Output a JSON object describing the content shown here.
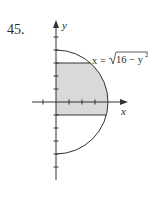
{
  "problem": {
    "number": "45."
  },
  "diagram": {
    "axes": {
      "x_label": "x",
      "y_label": "y",
      "unit_px": 13,
      "x_ticks": [
        -1,
        1,
        2,
        3
      ],
      "y_ticks": [
        -4,
        -3,
        -2,
        -1,
        1,
        2,
        3,
        4,
        5
      ]
    },
    "curve": {
      "equation_lhs": "x =",
      "equation_rhs": "16 − y",
      "exponent": "2",
      "description": "right half of circle of radius 4",
      "radius": 4
    },
    "shaded_region": {
      "y_min": -1,
      "y_max": 3,
      "x_min": 0,
      "bound_right": "x = √(16 − y²)",
      "fill": "#d9d9d9"
    },
    "colors": {
      "stroke": "#333333",
      "fill": "#d9d9d9"
    }
  }
}
